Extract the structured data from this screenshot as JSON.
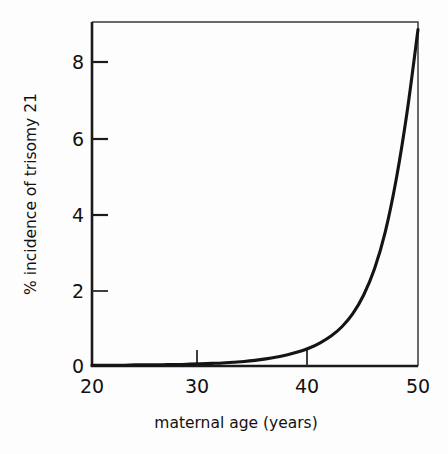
{
  "chart_data": {
    "type": "line",
    "title": "",
    "subtitle": "",
    "xlabel": "maternal age (years)",
    "ylabel": "% incidence of trisomy 21",
    "xlim": [
      20,
      50
    ],
    "ylim": [
      0,
      9.2
    ],
    "xticks": [
      20,
      30,
      40,
      50
    ],
    "xticklabels": [
      "20",
      "30",
      "40",
      "50"
    ],
    "yticks": [
      0,
      2,
      4,
      6,
      8
    ],
    "yticklabels": [
      "0",
      "2",
      "4",
      "6",
      "8"
    ],
    "grid": false,
    "legend": null,
    "legend_position": "none",
    "series": [
      {
        "name": "% incidence of trisomy 21",
        "color": "#141414",
        "x": [
          20,
          21,
          22,
          23,
          24,
          25,
          26,
          27,
          28,
          29,
          30,
          31,
          32,
          33,
          34,
          35,
          36,
          37,
          38,
          39,
          40,
          41,
          42,
          43,
          44,
          45,
          46,
          47,
          48,
          49,
          50
        ],
        "y": [
          0.02,
          0.02,
          0.02,
          0.02,
          0.03,
          0.03,
          0.03,
          0.04,
          0.04,
          0.05,
          0.06,
          0.07,
          0.08,
          0.1,
          0.12,
          0.15,
          0.19,
          0.24,
          0.3,
          0.38,
          0.48,
          0.62,
          0.8,
          1.05,
          1.4,
          1.9,
          2.6,
          3.6,
          5.0,
          6.8,
          9.0
        ]
      }
    ],
    "annotations": []
  },
  "axes": {
    "y_title": "% incidence of trisomy 21",
    "x_title": "maternal age (years)",
    "y_tick_0": "0",
    "y_tick_2": "2",
    "y_tick_4": "4",
    "y_tick_6": "6",
    "y_tick_8": "8",
    "x_tick_20": "20",
    "x_tick_30": "30",
    "x_tick_40": "40",
    "x_tick_50": "50"
  },
  "colors": {
    "background": "#fdfdfd",
    "curve": "#141414",
    "axis": "#1b1b1b",
    "frame": "#3a3a3a",
    "text": "#121212"
  }
}
